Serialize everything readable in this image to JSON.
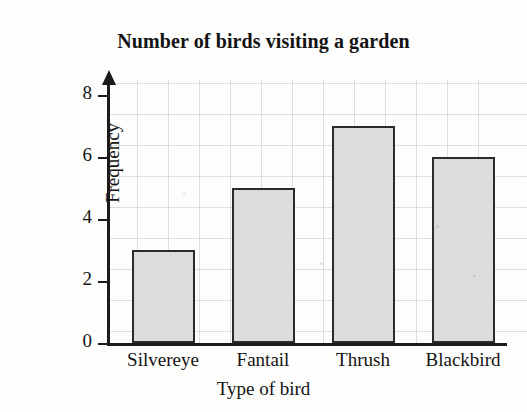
{
  "chart_data": {
    "type": "bar",
    "title": "Number of birds visiting a garden",
    "xlabel": "Type of bird",
    "ylabel": "Frequency",
    "categories": [
      "Silvereye",
      "Fantail",
      "Thrush",
      "Blackbird"
    ],
    "values": [
      3,
      5,
      7,
      6
    ],
    "ylim": [
      0,
      8.6
    ],
    "ytick_labels": [
      "0",
      "2",
      "4",
      "6",
      "8"
    ],
    "ytick_values": [
      0,
      2,
      4,
      6,
      8
    ],
    "grid": true,
    "legend": "none",
    "bar_fill_color": "#dcdcdc",
    "bar_edge_color": "#2b2b2b",
    "axis_color": "#1b1b1b",
    "grid_color": "#969696",
    "background_color": "#fdfdfc"
  }
}
